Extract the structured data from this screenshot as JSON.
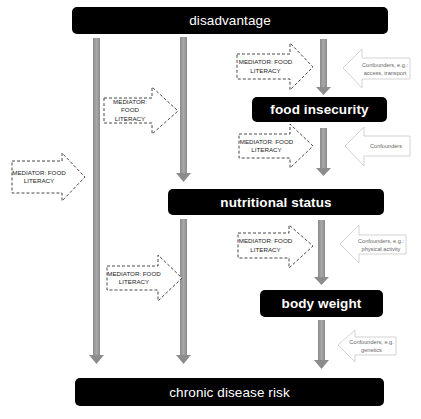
{
  "colors": {
    "box_fill": "#000000",
    "box_text": "#ffffff",
    "bar_gray": "#9a9a9a",
    "mediator_stroke": "#333333",
    "confounder_stroke": "#c8c8c8"
  },
  "nodes": {
    "disadvantage": "disadvantage",
    "food_insecurity": "food insecurity",
    "nutritional_status": "nutritional status",
    "body_weight": "body weight",
    "chronic_disease_risk": "chronic disease risk"
  },
  "mediators": [
    {
      "line1": "MEDIATOR: FOOD",
      "line2": "LITERACY"
    },
    {
      "line1": "MEDIATOR: FOOD",
      "line2": "LITERACY"
    },
    {
      "line1": "MEDIATOR: FOOD",
      "line2": "LITERACY"
    },
    {
      "line1": "MEDIATOR: FOOD",
      "line2": "LITERACY"
    },
    {
      "line1": "MEDIATOR: FOOD",
      "line2": "LITERACY"
    },
    {
      "line1": "MEDIATOR: FOOD",
      "line2": "LITERACY"
    }
  ],
  "confounders": [
    {
      "line1": "Confounders, e.g.:",
      "line2": "access, transport"
    },
    {
      "line1": "Confounders",
      "line2": ""
    },
    {
      "line1": "Confounders, e.g.:",
      "line2": "physical activity"
    },
    {
      "line1": "Confounders, e.g.",
      "line2": "genetics"
    }
  ]
}
